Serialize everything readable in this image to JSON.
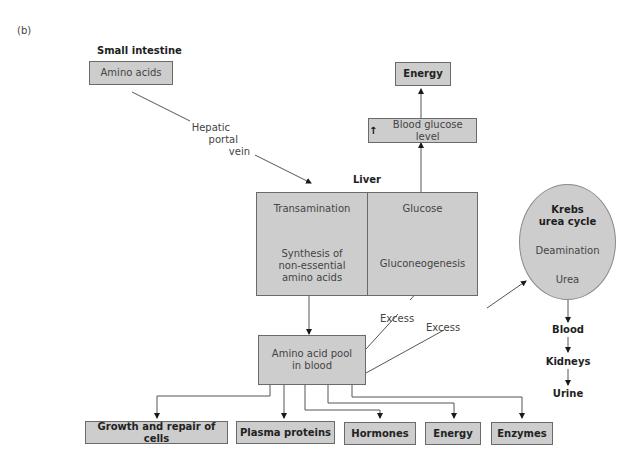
{
  "figure_label": "(b)",
  "small_intestine": {
    "heading": "Small intestine",
    "box": "Amino acids"
  },
  "hepatic_portal_vein": {
    "line1": "Hepatic",
    "line2": "portal",
    "line3": "vein"
  },
  "energy_top": "Energy",
  "blood_glucose": {
    "arrow_glyph": "↑",
    "text": "Blood glucose level"
  },
  "liver": {
    "heading": "Liver",
    "left_panel": {
      "top": "Transamination",
      "bottom_line1": "Synthesis of",
      "bottom_line2": "non-essential",
      "bottom_line3": "amino acids"
    },
    "right_panel": {
      "top": "Glucose",
      "bottom": "Gluconeogenesis"
    }
  },
  "krebs": {
    "heading_line1": "Krebs",
    "heading_line2": "urea cycle",
    "step1": "Deamination",
    "step2": "Urea"
  },
  "excretion": {
    "step1": "Blood",
    "step2": "Kidneys",
    "step3": "Urine"
  },
  "excess_labels": {
    "to_gluconeogenesis": "Excess",
    "to_krebs": "Excess"
  },
  "amino_acid_pool": {
    "line1": "Amino acid pool",
    "line2": "in blood"
  },
  "outputs": [
    "Growth and repair of cells",
    "Plasma proteins",
    "Hormones",
    "Energy",
    "Enzymes"
  ],
  "colors": {
    "box_fill": "#cdcdcd",
    "box_border": "#6a6a6a",
    "line": "#555555",
    "text": "#333333"
  }
}
